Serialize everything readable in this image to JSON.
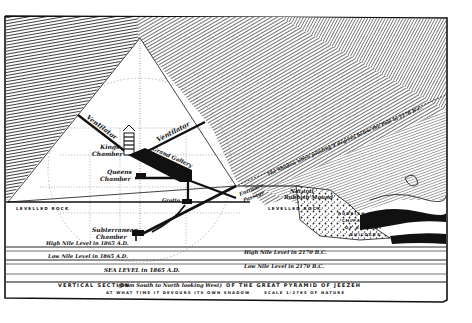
{
  "diagram": {
    "title": "VERTICAL SECTION (from South to North looking West) OF THE GREAT PYRAMID OF JEEZEH",
    "subtitle": "AT WHAT TIME IT DEVOURS ITS OWN SHADOW",
    "scale": "SCALE 1/2785 OF NATURE",
    "title_parts": {
      "a": "VERTICAL SECTION",
      "b": "(from South to North looking West)",
      "c": "OF THE GREAT PYRAMID OF JEEZEH"
    },
    "labels": {
      "ventilator_north": "Ventilator",
      "ventilator_south": "Ventilator",
      "kings_chamber_1": "Kings",
      "kings_chamber_2": "Chamber",
      "grand_gallery": "Grand Gallery",
      "queens_chamber_1": "Queens",
      "queens_chamber_2": "Chamber",
      "grotto": "Grotto",
      "entrance_passage_1": "Entrance",
      "entrance_passage_2": "Passage",
      "natural_rubbish_1": "Natural",
      "natural_rubbish_2": "Rubbish Mound",
      "levelled_rock_left": "LEVELLED ROCK",
      "levelled_rock_right": "LEVELLED ROCK",
      "subterranean_1": "Subterranean",
      "subterranean_2": "Chamber",
      "rubbish_ancient_1": "RUBBISH",
      "rubbish_ancient_2": "CHIPS",
      "rubbish_ancient_3": "OF ANCIENT",
      "rubbish_ancient_4": "BUILDERS",
      "shadow_line": "The Shadow when pointing 4 degrees below the Pole in 2170 B.C.",
      "high_nile_1865": "High Nile Level in 1865 A.D.",
      "low_nile_1865": "Low Nile Level in 1865 A.D.",
      "high_nile_2170": "High Nile Level in 2170 B.C.",
      "low_nile_2170": "Low Nile Level in 2170 B.C.",
      "sea_level": "SEA LEVEL in 1865 A.D."
    },
    "colors": {
      "ink": "#111111",
      "paper": "#ffffff",
      "hatch": "#2a2a2a"
    }
  }
}
